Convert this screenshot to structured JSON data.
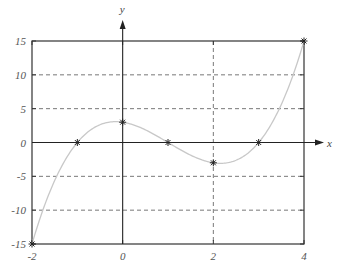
{
  "chart_data": {
    "type": "line",
    "title": "",
    "xlabel": "x",
    "ylabel": "y",
    "xlim": [
      -2,
      4
    ],
    "ylim": [
      -15,
      15
    ],
    "grid": {
      "horizontal_dashed": [
        -10,
        -5,
        5,
        10
      ],
      "vertical_dashed": [
        2
      ]
    },
    "x_ticks": [
      -2,
      0,
      2,
      4
    ],
    "y_ticks": [
      -15,
      -10,
      -5,
      0,
      5,
      10,
      15
    ],
    "x_tick_labels": [
      "-2",
      "0",
      "2",
      "4"
    ],
    "y_tick_labels": [
      "-15",
      "-10",
      "-5",
      "0",
      "5",
      "10",
      "15"
    ],
    "series": [
      {
        "name": "curve",
        "function": "y = x^3 - 3x^2 - x + 3",
        "style": "smooth",
        "color": "#c8c8c8"
      },
      {
        "name": "markers",
        "marker": "asterisk",
        "color": "#222222",
        "x": [
          -2,
          -1,
          0,
          1,
          2,
          3,
          4
        ],
        "y": [
          -15,
          0,
          3,
          0,
          -3,
          0,
          15
        ]
      }
    ]
  },
  "labels": {
    "x_axis": "x",
    "y_axis": "y",
    "caption_truncated": ""
  }
}
